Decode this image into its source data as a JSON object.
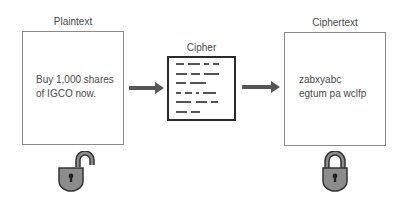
{
  "plaintext": {
    "label": "Plaintext",
    "line1": "Buy 1,000 shares",
    "line2": "of IGCO now."
  },
  "cipher": {
    "label": "Cipher",
    "dash_rows": [
      [
        [
          0,
          8
        ],
        [
          12,
          12
        ],
        [
          28,
          5
        ],
        [
          37,
          6
        ]
      ],
      [
        [
          0,
          11
        ],
        [
          15,
          9
        ],
        [
          28,
          15
        ]
      ],
      [
        [
          0,
          10
        ],
        [
          14,
          16
        ]
      ],
      [
        [
          0,
          5
        ],
        [
          9,
          7
        ],
        [
          20,
          3
        ],
        [
          27,
          13
        ]
      ],
      [
        [
          0,
          15
        ],
        [
          20,
          11
        ],
        [
          35,
          7
        ]
      ],
      [
        [
          0,
          11
        ],
        [
          15,
          9
        ]
      ]
    ]
  },
  "ciphertext": {
    "label": "Ciphertext",
    "line1": "zabxyabc",
    "line2": "egtum pa wclfp"
  },
  "icons": {
    "unlocked": "unlocked-padlock-icon",
    "locked": "locked-padlock-icon",
    "arrow": "right-arrow-icon"
  },
  "colors": {
    "box_border": "#8a8a8a",
    "cipher_border": "#2a2a2a",
    "dash": "#555555",
    "arrow": "#555555",
    "lock_body": "#8c8c8c",
    "lock_outline": "#333333"
  }
}
